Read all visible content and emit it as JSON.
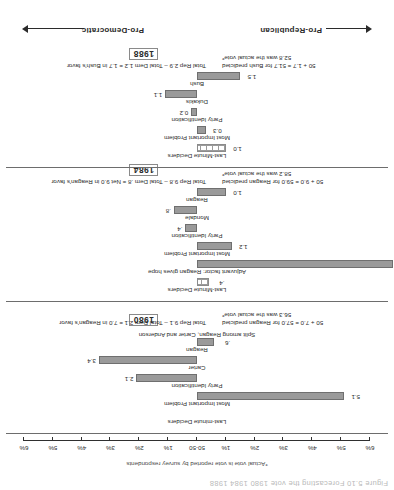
{
  "caption_top": "Figure 5.10    Forecasting the vote    1980  1984  1988",
  "footnote": "*Actual vote is vote reported by survey respondents",
  "axis": {
    "labels": [
      "6%",
      "5%",
      "4%",
      "3%",
      "2%",
      "1%",
      "50-50",
      "1%",
      "2%",
      "3%",
      "4%",
      "5%",
      "6%"
    ],
    "center_label": "50-50"
  },
  "legend": {
    "pro_democratic": "Pro-Democratic",
    "pro_republican": "Pro-Republican"
  },
  "chart_data": {
    "type": "bar",
    "title": "Forecasting the vote 1980 1984 1988",
    "xlabel": "",
    "ylabel": "",
    "xlim": [
      -6,
      6
    ],
    "grid": false,
    "legend_position": "bottom",
    "axis_ticks": [
      -6,
      -5,
      -4,
      -3,
      -2,
      -1,
      0,
      1,
      2,
      3,
      4,
      5,
      6
    ],
    "axis_tick_labels": [
      "6%",
      "5%",
      "4%",
      "3%",
      "2%",
      "1%",
      "50-50",
      "1%",
      "2%",
      "3%",
      "4%",
      "5%",
      "6%"
    ],
    "annotations": [
      "*Actual vote is vote reported by survey respondents"
    ],
    "panels": [
      {
        "year": "1980",
        "rows": [
          {
            "label": "Reagan",
            "value": 0.6,
            "display": ".6",
            "direction": "republican",
            "style": "solid"
          },
          {
            "label": "Carter",
            "value": 3.4,
            "display": "3.4",
            "direction": "democratic",
            "style": "solid"
          },
          {
            "label": "Party Identification",
            "value": 2.1,
            "display": "2.1",
            "direction": "democratic",
            "style": "solid"
          },
          {
            "label": "Most Important Problem",
            "value": 5.1,
            "display": "5.1",
            "direction": "republican",
            "style": "solid"
          },
          {
            "label": "Last-minute Deciders",
            "value": 0,
            "display": "",
            "direction": "none",
            "style": "none"
          }
        ],
        "subnote": "Split among Reagan, Carter and Anderson",
        "summary_left": "Total Rep 9.1 – Total Dem 2.1 = 7.0 in Reagan's favor",
        "summary_right_line1": "50 + 7.0 = 57.0 for Reagan predicted",
        "summary_right_line2": "56.3 was the actual vote*"
      },
      {
        "year": "1984",
        "rows": [
          {
            "label": "Reagan",
            "value": 1.0,
            "display": "1.0",
            "direction": "republican",
            "style": "solid"
          },
          {
            "label": "Mondale",
            "value": 0.8,
            "display": ".8",
            "direction": "democratic",
            "style": "solid"
          },
          {
            "label": "Party Identification",
            "value": 0.4,
            "display": ".4",
            "direction": "democratic",
            "style": "solid"
          },
          {
            "label": "Most Important Problem",
            "value": 1.2,
            "display": "1.2",
            "direction": "republican",
            "style": "solid"
          },
          {
            "label": "Adjuvant factor:  Reagan gives hope",
            "value": 6.8,
            "display": "6.8",
            "direction": "republican",
            "style": "solid"
          },
          {
            "label": "Last-Minute Deciders",
            "value": 0.4,
            "display": ".4",
            "direction": "republican",
            "style": "hatch"
          }
        ],
        "subnote": "",
        "summary_left": "Total Rep 9.8 – Total Dem .8 = Net 9.0 in Reagan's favor",
        "summary_right_line1": "50 + 9.0 = 59.0 for Reagan predicted",
        "summary_right_line2": "58.2 was the actual vote*"
      },
      {
        "year": "1988",
        "rows": [
          {
            "label": "Bush",
            "value": 1.5,
            "display": "1.5",
            "direction": "republican",
            "style": "solid"
          },
          {
            "label": "Dukakis",
            "value": 1.1,
            "display": "1.1",
            "direction": "democratic",
            "style": "solid"
          },
          {
            "label": "Party Identification",
            "value": 0.2,
            "display": "0.2",
            "direction": "democratic",
            "style": "solid"
          },
          {
            "label": "Most Important Problem",
            "value": 0.3,
            "display": "0.3",
            "direction": "republican",
            "style": "solid"
          },
          {
            "label": "Last-Minute Deciders",
            "value": 1.0,
            "display": "1.0",
            "direction": "republican",
            "style": "hatch"
          }
        ],
        "subnote": "",
        "summary_left": "Total Rep 2.9 – Total Dem 1.2 =  1.7 in Bush's favor",
        "summary_right_line1": "50 + 1.7 = 51.7 for Bush predicted",
        "summary_right_line2": "52.8 was the actual vote*"
      }
    ]
  }
}
